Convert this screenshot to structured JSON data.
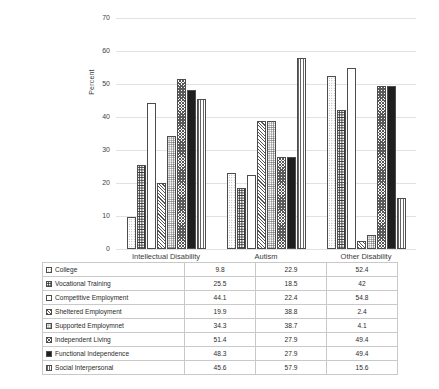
{
  "chart_data": {
    "type": "bar",
    "title": "",
    "xlabel": "",
    "ylabel": "Percent",
    "ylim": [
      0,
      70
    ],
    "yticks": [
      0,
      10,
      20,
      30,
      40,
      50,
      60,
      70
    ],
    "grid": true,
    "legend_position": "table-below",
    "categories": [
      "Intellectual Disability",
      "Autism",
      "Other Disability"
    ],
    "series": [
      {
        "name": "College",
        "values": [
          9.8,
          22.9,
          52.4
        ],
        "pattern": "dots-light",
        "color": "#b4b4b4"
      },
      {
        "name": "Vocational Training",
        "values": [
          25.5,
          18.5,
          42
        ],
        "pattern": "dots-dark",
        "color": "#6b6b6b"
      },
      {
        "name": "Competitive Employment",
        "values": [
          44.1,
          22.4,
          54.8
        ],
        "pattern": "solid-white",
        "color": "#ffffff"
      },
      {
        "name": "Sheltered Employment",
        "values": [
          19.9,
          38.8,
          2.4
        ],
        "pattern": "hatch-dense",
        "color": "#8a8a8a"
      },
      {
        "name": "Supported Employmnet",
        "values": [
          34.3,
          38.7,
          4.1
        ],
        "pattern": "dots-mid",
        "color": "#9c9c9c"
      },
      {
        "name": "Independent Living",
        "values": [
          51.4,
          27.9,
          49.4
        ],
        "pattern": "checker",
        "color": "#7d7d7d"
      },
      {
        "name": "Functional Independence",
        "values": [
          48.3,
          27.9,
          49.4
        ],
        "pattern": "solid-black",
        "color": "#2b2b2b"
      },
      {
        "name": "Social Interpersonal",
        "values": [
          45.6,
          57.9,
          15.6
        ],
        "pattern": "stripes-vert",
        "color": "#8f8f8f"
      }
    ]
  }
}
